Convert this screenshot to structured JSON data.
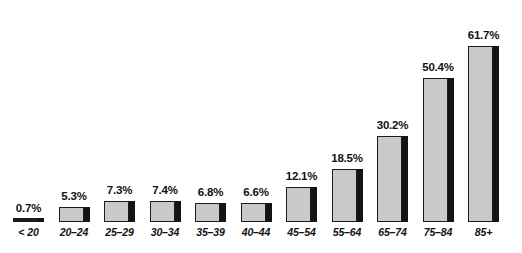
{
  "chart_data": {
    "type": "bar",
    "title": "",
    "subtitle": "",
    "xlabel": "",
    "ylabel": "",
    "ylim": [
      0,
      70
    ],
    "grid": false,
    "legend": null,
    "value_suffix": "%",
    "categories": [
      "< 20",
      "20–24",
      "25–29",
      "30–34",
      "35–39",
      "40–44",
      "45–54",
      "55–64",
      "65–74",
      "75–84",
      "85+"
    ],
    "values": [
      0.7,
      5.3,
      7.3,
      7.4,
      6.8,
      6.6,
      12.1,
      18.5,
      30.2,
      50.4,
      61.7
    ],
    "value_labels": [
      "0.7%",
      "5.3%",
      "7.3%",
      "7.4%",
      "6.8%",
      "6.6%",
      "12.1%",
      "18.5%",
      "30.2%",
      "50.4%",
      "61.7%"
    ],
    "series": [
      {
        "name": "",
        "values": [
          0.7,
          5.3,
          7.3,
          7.4,
          6.8,
          6.6,
          12.1,
          18.5,
          30.2,
          50.4,
          61.7
        ]
      }
    ]
  },
  "style": {
    "bar_face_color": "#c9c9c9",
    "bar_shadow_color": "#141414",
    "bar_outline_color": "#1c1c1c",
    "text_color": "#111111",
    "background_color": "#ffffff"
  }
}
